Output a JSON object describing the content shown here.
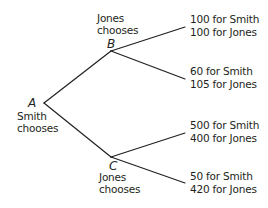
{
  "diagram": {
    "type": "game-tree",
    "line_color": "#231f20",
    "nodes": {
      "A": {
        "letter": "A",
        "caption_line1": "Smith",
        "caption_line2": "chooses"
      },
      "B": {
        "letter": "B",
        "caption_line1": "Jones",
        "caption_line2": "chooses"
      },
      "C": {
        "letter": "C",
        "caption_line1": "Jones",
        "caption_line2": "chooses"
      }
    },
    "payoffs": [
      {
        "from": "B",
        "smith": "100 for Smith",
        "jones": "100 for Jones"
      },
      {
        "from": "B",
        "smith": "60 for Smith",
        "jones": "105 for Jones"
      },
      {
        "from": "C",
        "smith": "500 for Smith",
        "jones": "400 for Jones"
      },
      {
        "from": "C",
        "smith": "50 for Smith",
        "jones": "420 for Jones"
      }
    ],
    "edges": [
      {
        "from": "A",
        "to": "B"
      },
      {
        "from": "A",
        "to": "C"
      },
      {
        "from": "B",
        "to": "payoff-0"
      },
      {
        "from": "B",
        "to": "payoff-1"
      },
      {
        "from": "C",
        "to": "payoff-2"
      },
      {
        "from": "C",
        "to": "payoff-3"
      }
    ]
  }
}
